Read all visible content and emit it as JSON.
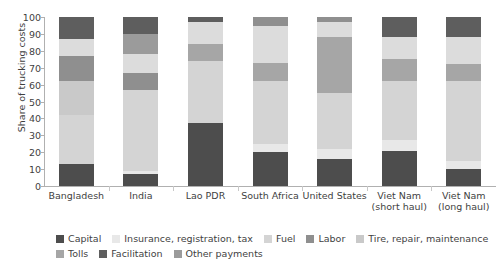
{
  "chart_data": {
    "type": "bar",
    "subtype": "stacked-percent",
    "title": "",
    "xlabel": "",
    "ylabel": "Share of trucking costs",
    "ylim": [
      0,
      100
    ],
    "yticks": [
      0,
      10,
      20,
      30,
      40,
      50,
      60,
      70,
      80,
      90,
      100
    ],
    "grid": false,
    "legend_position": "bottom",
    "categories": [
      "Bangladesh",
      "India",
      "Lao PDR",
      "South Africa",
      "United States",
      "Viet Nam (short haul)",
      "Viet Nam (long haul)"
    ],
    "category_lines": [
      [
        "Bangladesh",
        ""
      ],
      [
        "India",
        ""
      ],
      [
        "Lao PDR",
        ""
      ],
      [
        "South Africa",
        ""
      ],
      [
        "United States",
        ""
      ],
      [
        "Viet Nam",
        "(short haul)"
      ],
      [
        "Viet Nam",
        "(long haul)"
      ]
    ],
    "series": [
      {
        "name": "Capital",
        "color": "#4d4d4d",
        "values": [
          13,
          7,
          37,
          20,
          16,
          21,
          10
        ]
      },
      {
        "name": "Insurance, registration, tax",
        "color": "#e8e8e8",
        "values": [
          0,
          2,
          0,
          5,
          6,
          6,
          5
        ]
      },
      {
        "name": "Fuel",
        "color": "#d4d4d4",
        "values": [
          29,
          48,
          37,
          37,
          33,
          35,
          47
        ]
      },
      {
        "name": "Labor",
        "color": "#a6a6a6",
        "values": [
          0,
          0,
          0,
          0,
          0,
          0,
          0
        ]
      },
      {
        "name": "Tire, repair, maintenance",
        "color": "#c9c9c9",
        "values": [
          20,
          0,
          0,
          0,
          0,
          0,
          0
        ]
      },
      {
        "name": "Tolls",
        "color": "#8f8f8f",
        "values": [
          15,
          10,
          10,
          11,
          33,
          13,
          10
        ]
      },
      {
        "name": "Facilitation",
        "color": "#dcdcdc",
        "values": [
          10,
          11,
          13,
          22,
          9,
          13,
          16
        ]
      },
      {
        "name": "Other payments",
        "color": "#5e5e5e",
        "values": [
          13,
          22,
          3,
          5,
          3,
          12,
          12
        ]
      }
    ],
    "legend_entries": [
      {
        "label": "Capital",
        "color": "#4d4d4d"
      },
      {
        "label": "Insurance, registration, tax",
        "color": "#e8e8e8"
      },
      {
        "label": "Fuel",
        "color": "#d4d4d4"
      },
      {
        "label": "Labor",
        "color": "#8f8f8f"
      },
      {
        "label": "Tire, repair, maintenance",
        "color": "#c9c9c9"
      },
      {
        "label": "Tolls",
        "color": "#a6a6a6"
      },
      {
        "label": "Facilitation",
        "color": "#5e5e5e"
      },
      {
        "label": "Other payments",
        "color": "#9b9b9b"
      }
    ],
    "legend_rows": [
      [
        0,
        1,
        2,
        3,
        4
      ],
      [
        5,
        6,
        7
      ]
    ],
    "stacks": [
      {
        "category": "Bangladesh",
        "segments": [
          {
            "label": "Capital",
            "from": 0,
            "to": 13,
            "color": "#4d4d4d"
          },
          {
            "label": "Fuel",
            "from": 13,
            "to": 42,
            "color": "#d4d4d4"
          },
          {
            "label": "Tire, repair, maintenance",
            "from": 42,
            "to": 62,
            "color": "#c9c9c9"
          },
          {
            "label": "Tolls",
            "from": 62,
            "to": 77,
            "color": "#8f8f8f"
          },
          {
            "label": "Facilitation",
            "from": 77,
            "to": 87,
            "color": "#dcdcdc"
          },
          {
            "label": "Other payments",
            "from": 87,
            "to": 100,
            "color": "#5e5e5e"
          }
        ]
      },
      {
        "category": "India",
        "segments": [
          {
            "label": "Capital",
            "from": 0,
            "to": 7,
            "color": "#4d4d4d"
          },
          {
            "label": "Insurance, registration, tax",
            "from": 7,
            "to": 9,
            "color": "#e8e8e8"
          },
          {
            "label": "Fuel",
            "from": 9,
            "to": 57,
            "color": "#d4d4d4"
          },
          {
            "label": "Tolls",
            "from": 57,
            "to": 67,
            "color": "#8f8f8f"
          },
          {
            "label": "Facilitation",
            "from": 67,
            "to": 78,
            "color": "#dcdcdc"
          },
          {
            "label": "Other payments",
            "from": 78,
            "to": 90,
            "color": "#9b9b9b"
          },
          {
            "label": "Other payments",
            "from": 90,
            "to": 100,
            "color": "#5e5e5e"
          }
        ]
      },
      {
        "category": "Lao PDR",
        "segments": [
          {
            "label": "Capital",
            "from": 0,
            "to": 37,
            "color": "#4d4d4d"
          },
          {
            "label": "Fuel",
            "from": 37,
            "to": 74,
            "color": "#d4d4d4"
          },
          {
            "label": "Tolls",
            "from": 74,
            "to": 84,
            "color": "#a6a6a6"
          },
          {
            "label": "Facilitation",
            "from": 84,
            "to": 97,
            "color": "#dcdcdc"
          },
          {
            "label": "Other payments",
            "from": 97,
            "to": 100,
            "color": "#5e5e5e"
          }
        ]
      },
      {
        "category": "South Africa",
        "segments": [
          {
            "label": "Capital",
            "from": 0,
            "to": 20,
            "color": "#4d4d4d"
          },
          {
            "label": "Insurance, registration, tax",
            "from": 20,
            "to": 25,
            "color": "#e8e8e8"
          },
          {
            "label": "Fuel",
            "from": 25,
            "to": 62,
            "color": "#d4d4d4"
          },
          {
            "label": "Tolls",
            "from": 62,
            "to": 73,
            "color": "#a6a6a6"
          },
          {
            "label": "Facilitation",
            "from": 73,
            "to": 95,
            "color": "#dcdcdc"
          },
          {
            "label": "Other payments",
            "from": 95,
            "to": 100,
            "color": "#8f8f8f"
          }
        ]
      },
      {
        "category": "United States",
        "segments": [
          {
            "label": "Capital",
            "from": 0,
            "to": 16,
            "color": "#4d4d4d"
          },
          {
            "label": "Insurance, registration, tax",
            "from": 16,
            "to": 22,
            "color": "#e8e8e8"
          },
          {
            "label": "Fuel",
            "from": 22,
            "to": 55,
            "color": "#d4d4d4"
          },
          {
            "label": "Tolls",
            "from": 55,
            "to": 88,
            "color": "#a6a6a6"
          },
          {
            "label": "Facilitation",
            "from": 88,
            "to": 97,
            "color": "#dcdcdc"
          },
          {
            "label": "Other payments",
            "from": 97,
            "to": 100,
            "color": "#8f8f8f"
          }
        ]
      },
      {
        "category": "Viet Nam (short haul)",
        "segments": [
          {
            "label": "Capital",
            "from": 0,
            "to": 21,
            "color": "#4d4d4d"
          },
          {
            "label": "Insurance, registration, tax",
            "from": 21,
            "to": 27,
            "color": "#e8e8e8"
          },
          {
            "label": "Fuel",
            "from": 27,
            "to": 62,
            "color": "#d4d4d4"
          },
          {
            "label": "Tolls",
            "from": 62,
            "to": 75,
            "color": "#a6a6a6"
          },
          {
            "label": "Facilitation",
            "from": 75,
            "to": 88,
            "color": "#dcdcdc"
          },
          {
            "label": "Other payments",
            "from": 88,
            "to": 100,
            "color": "#5e5e5e"
          }
        ]
      },
      {
        "category": "Viet Nam (long haul)",
        "segments": [
          {
            "label": "Capital",
            "from": 0,
            "to": 10,
            "color": "#4d4d4d"
          },
          {
            "label": "Insurance, registration, tax",
            "from": 10,
            "to": 15,
            "color": "#e8e8e8"
          },
          {
            "label": "Fuel",
            "from": 15,
            "to": 62,
            "color": "#d4d4d4"
          },
          {
            "label": "Tolls",
            "from": 62,
            "to": 72,
            "color": "#a6a6a6"
          },
          {
            "label": "Facilitation",
            "from": 72,
            "to": 88,
            "color": "#dcdcdc"
          },
          {
            "label": "Other payments",
            "from": 88,
            "to": 100,
            "color": "#5e5e5e"
          }
        ]
      }
    ]
  }
}
